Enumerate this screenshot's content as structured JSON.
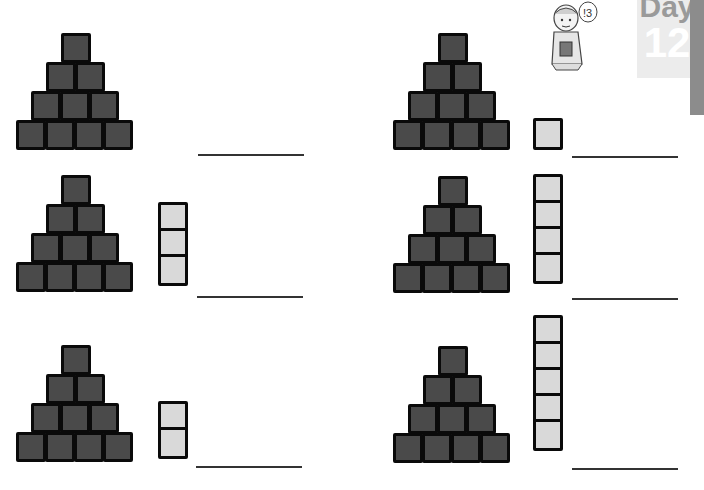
{
  "header": {
    "day_word": "Day",
    "day_number": "12",
    "mascot_speech": "!3",
    "mascot": "boy-thinking-icon"
  },
  "colors": {
    "block_fill": "#4a4a4a",
    "block_border": "#0a0a0a",
    "stack_fill": "#d9d9d9",
    "day_badge_bg": "#ececec",
    "side_tab": "#8c8c8c"
  },
  "problems": [
    {
      "id": 1,
      "pyramid_rows": [
        1,
        2,
        3,
        4
      ],
      "pyramid_blocks": 10,
      "stack_blocks": 0,
      "answer": ""
    },
    {
      "id": 2,
      "pyramid_rows": [
        1,
        2,
        3,
        4
      ],
      "pyramid_blocks": 10,
      "stack_blocks": 1,
      "answer": ""
    },
    {
      "id": 3,
      "pyramid_rows": [
        1,
        2,
        3,
        4
      ],
      "pyramid_blocks": 10,
      "stack_blocks": 3,
      "answer": ""
    },
    {
      "id": 4,
      "pyramid_rows": [
        1,
        2,
        3,
        4
      ],
      "pyramid_blocks": 10,
      "stack_blocks": 4,
      "answer": ""
    },
    {
      "id": 5,
      "pyramid_rows": [
        1,
        2,
        3,
        4
      ],
      "pyramid_blocks": 10,
      "stack_blocks": 2,
      "answer": ""
    },
    {
      "id": 6,
      "pyramid_rows": [
        1,
        2,
        3,
        4
      ],
      "pyramid_blocks": 10,
      "stack_blocks": 5,
      "answer": ""
    }
  ]
}
